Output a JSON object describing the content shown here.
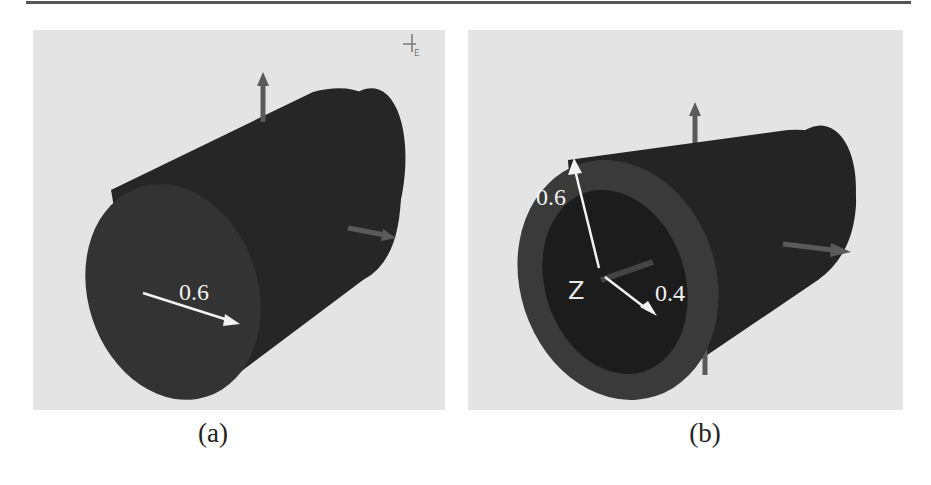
{
  "figure": {
    "panels": [
      {
        "id": "a",
        "caption": "(a)",
        "shape": "solid cylinder",
        "dimension_labels": [
          "0.6"
        ],
        "corner_icon_label": "E",
        "colors": {
          "background": "#e4e4e4",
          "body": "#262626",
          "end_face": "#333333",
          "axis_arrow": "#5a5a5a",
          "annotation": "#f2f2f2"
        }
      },
      {
        "id": "b",
        "caption": "(b)",
        "shape": "hollow cylinder",
        "dimension_labels": [
          "0.6",
          "0.4"
        ],
        "axis_label": "Z",
        "colors": {
          "background": "#e4e4e4",
          "body": "#242424",
          "ring_face": "#3a3a3a",
          "bore": "#1c1c1c",
          "axis_arrow": "#5a5a5a",
          "annotation": "#f2f2f2"
        }
      }
    ]
  }
}
